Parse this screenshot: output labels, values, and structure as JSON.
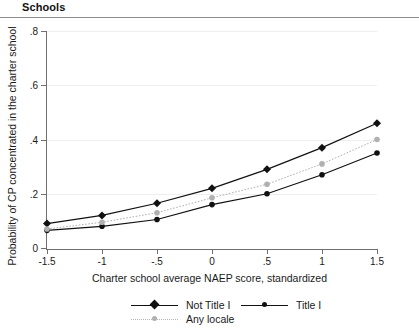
{
  "header": {
    "title": "Schools"
  },
  "chart_data": {
    "type": "line",
    "title": "Schools",
    "xlabel": "Charter school average NAEP score, standardized",
    "ylabel": "Probability of CP concentrated in the charter school",
    "x": [
      -1.5,
      -1,
      -0.5,
      0,
      0.5,
      1,
      1.5
    ],
    "xticklabels": [
      "-1.5",
      "-1",
      "-.5",
      "0",
      ".5",
      "1",
      "1.5"
    ],
    "yticks": [
      0,
      0.2,
      0.4,
      0.6,
      0.8
    ],
    "yticklabels": [
      "0",
      ".2",
      ".4",
      ".6",
      ".8"
    ],
    "xlim": [
      -1.5,
      1.5
    ],
    "ylim": [
      0,
      0.8
    ],
    "grid": true,
    "legend_position": "bottom",
    "series": [
      {
        "name": "Not Title I",
        "color": "#111111",
        "marker": "diamond",
        "linestyle": "solid",
        "values": [
          0.09,
          0.12,
          0.165,
          0.22,
          0.29,
          0.37,
          0.46
        ]
      },
      {
        "name": "Title I",
        "color": "#111111",
        "marker": "circle",
        "linestyle": "solid",
        "values": [
          0.065,
          0.08,
          0.105,
          0.16,
          0.2,
          0.27,
          0.35
        ]
      },
      {
        "name": "Any locale",
        "color": "#b0b0b0",
        "marker": "circle",
        "linestyle": "dotted",
        "values": [
          0.07,
          0.095,
          0.13,
          0.185,
          0.235,
          0.31,
          0.4
        ]
      }
    ]
  },
  "legend": {
    "items": [
      {
        "label": "Not Title I"
      },
      {
        "label": "Title I"
      },
      {
        "label": "Any locale"
      }
    ]
  }
}
